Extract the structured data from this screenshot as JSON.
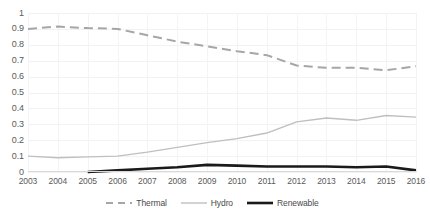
{
  "chart_data": {
    "type": "line",
    "title": "",
    "xlabel": "",
    "ylabel": "",
    "categories": [
      "2003",
      "2004",
      "2005",
      "2006",
      "2007",
      "2008",
      "2009",
      "2010",
      "2011",
      "2012",
      "2013",
      "2014",
      "2015",
      "2016"
    ],
    "ylim": [
      0,
      1
    ],
    "ytick_labels": [
      "1",
      "0.9",
      "0.8",
      "0.7",
      "0.6",
      "0.5",
      "0.4",
      "0.3",
      "0.2",
      "0.1",
      "0"
    ],
    "ytick_values": [
      1,
      0.9,
      0.8,
      0.7,
      0.6,
      0.5,
      0.4,
      0.3,
      0.2,
      0.1,
      0
    ],
    "grid": true,
    "legend_position": "bottom",
    "series": [
      {
        "name": "Thermal",
        "style": "dashed",
        "color": "#a6a6a6",
        "width": 2,
        "values": [
          0.9,
          0.915,
          0.905,
          0.9,
          0.86,
          0.82,
          0.79,
          0.76,
          0.735,
          0.67,
          0.655,
          0.655,
          0.64,
          0.665
        ]
      },
      {
        "name": "Hydro",
        "style": "solid",
        "color": "#bfbfbf",
        "width": 1.4,
        "values": [
          0.1,
          0.09,
          0.095,
          0.1,
          0.125,
          0.155,
          0.185,
          0.21,
          0.245,
          0.315,
          0.34,
          0.325,
          0.355,
          0.345
        ]
      },
      {
        "name": "Renewable",
        "style": "solid",
        "color": "#1a1a1a",
        "width": 2.6,
        "values": [
          null,
          null,
          0.0,
          0.01,
          0.02,
          0.03,
          0.045,
          0.04,
          0.035,
          0.035,
          0.035,
          0.03,
          0.035,
          0.01
        ]
      }
    ]
  },
  "legend": {
    "items": [
      {
        "label": "Thermal"
      },
      {
        "label": "Hydro"
      },
      {
        "label": "Renewable"
      }
    ]
  }
}
